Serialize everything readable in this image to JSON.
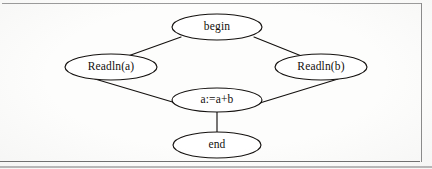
{
  "figure": {
    "kind": "flow-graph",
    "background_color": "#fdfdfc",
    "ink_color": "#14110f",
    "frame_color": "#8d8d8d"
  },
  "nodes": [
    {
      "id": "begin",
      "label": "begin",
      "cx": 217,
      "cy": 27,
      "rx": 45,
      "ry": 13
    },
    {
      "id": "readln_a",
      "label": "Readln(a)",
      "cx": 111,
      "cy": 67,
      "rx": 46,
      "ry": 13
    },
    {
      "id": "readln_b",
      "label": "Readln(b)",
      "cx": 321,
      "cy": 67,
      "rx": 46,
      "ry": 13
    },
    {
      "id": "assign",
      "label": "a:=a+b",
      "cx": 217,
      "cy": 100,
      "rx": 45,
      "ry": 12
    },
    {
      "id": "end",
      "label": "end",
      "cx": 217,
      "cy": 145,
      "rx": 44,
      "ry": 13
    }
  ],
  "edges": [
    {
      "id": "begin-readln_a",
      "from": "begin",
      "to": "readln_a",
      "x1": 181,
      "y1": 37,
      "x2": 128,
      "y2": 56,
      "arrow": false
    },
    {
      "id": "begin-readln_b",
      "from": "begin",
      "to": "readln_b",
      "x1": 254,
      "y1": 37,
      "x2": 304,
      "y2": 57,
      "arrow": false
    },
    {
      "id": "readln_a-assign",
      "from": "readln_a",
      "to": "assign",
      "x1": 95,
      "y1": 79,
      "x2": 186,
      "y2": 106,
      "arrow": false
    },
    {
      "id": "readln_b-assign",
      "from": "readln_b",
      "to": "assign",
      "x1": 338,
      "y1": 79,
      "x2": 250,
      "y2": 106,
      "arrow": false
    },
    {
      "id": "assign-end",
      "from": "assign",
      "to": "end",
      "x1": 217,
      "y1": 112,
      "x2": 217,
      "y2": 132,
      "arrow": false
    }
  ]
}
